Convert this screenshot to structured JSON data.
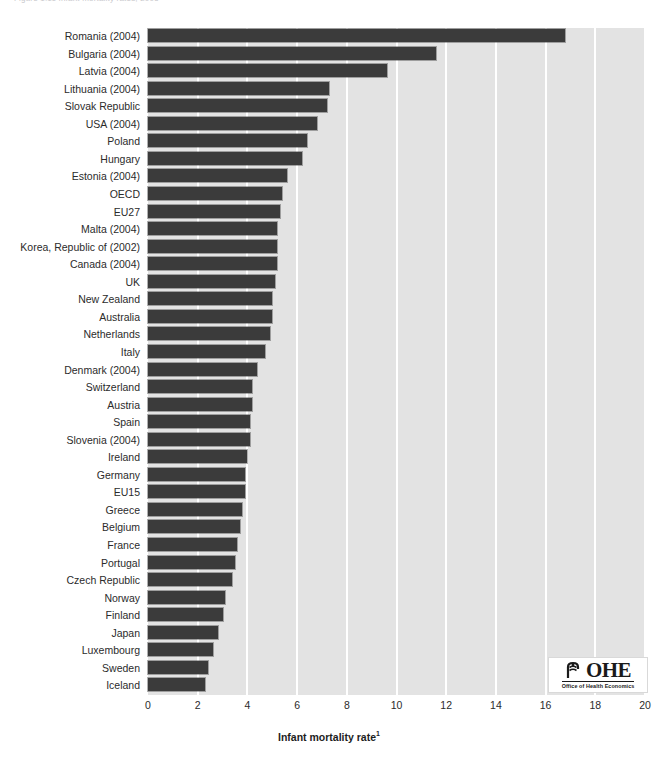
{
  "figure": {
    "caption": "Figure 1.11   Infant mortality rates, 2005",
    "logo": {
      "letters": "OHE",
      "tagline": "Office of Health Economics",
      "mark": "caduceus-icon"
    }
  },
  "chart_data": {
    "type": "bar",
    "orientation": "horizontal",
    "title": "",
    "xlabel": "Infant mortality rate",
    "xlabel_superscript": "1",
    "ylabel": "",
    "xlim": [
      0,
      20
    ],
    "xticks": [
      0,
      2,
      4,
      6,
      8,
      10,
      12,
      14,
      16,
      18,
      20
    ],
    "grid": "vertical",
    "legend": "none",
    "bar_color": "#3b3b3b",
    "plot_background": "#e3e3e3",
    "gridline_color": "#ffffff",
    "categories": [
      "Romania (2004)",
      "Bulgaria (2004)",
      "Latvia (2004)",
      "Lithuania (2004)",
      "Slovak Republic",
      "USA (2004)",
      "Poland",
      "Hungary",
      "Estonia (2004)",
      "OECD",
      "EU27",
      "Malta (2004)",
      "Korea, Republic of (2002)",
      "Canada (2004)",
      "UK",
      "New Zealand",
      "Australia",
      "Netherlands",
      "Italy",
      "Denmark (2004)",
      "Switzerland",
      "Austria",
      "Spain",
      "Slovenia (2004)",
      "Ireland",
      "Germany",
      "EU15",
      "Greece",
      "Belgium",
      "France",
      "Portugal",
      "Czech Republic",
      "Norway",
      "Finland",
      "Japan",
      "Luxembourg",
      "Sweden",
      "Iceland"
    ],
    "values": [
      16.8,
      11.6,
      9.6,
      7.3,
      7.2,
      6.8,
      6.4,
      6.2,
      5.6,
      5.4,
      5.3,
      5.2,
      5.2,
      5.2,
      5.1,
      5.0,
      5.0,
      4.9,
      4.7,
      4.4,
      4.2,
      4.2,
      4.1,
      4.1,
      4.0,
      3.9,
      3.9,
      3.8,
      3.7,
      3.6,
      3.5,
      3.4,
      3.1,
      3.0,
      2.8,
      2.6,
      2.4,
      2.3
    ]
  }
}
